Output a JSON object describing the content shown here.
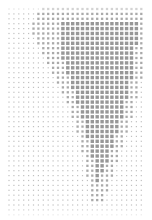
{
  "canvas": {
    "width": 152,
    "height": 220,
    "background": "#ffffff"
  },
  "grid": {
    "x0": 9,
    "y0": 9,
    "step": 4.9,
    "cols": 28,
    "rows": 43,
    "dot_color": "#8c8c8c",
    "min_size": 1.2,
    "max_size": 3.4
  },
  "shape": {
    "name": "silhouette",
    "polygon": [
      [
        40,
        8
      ],
      [
        145,
        8
      ],
      [
        145,
        60
      ],
      [
        138,
        95
      ],
      [
        128,
        130
      ],
      [
        118,
        160
      ],
      [
        108,
        190
      ],
      [
        102,
        205
      ],
      [
        92,
        200
      ],
      [
        86,
        170
      ],
      [
        80,
        140
      ],
      [
        70,
        110
      ],
      [
        55,
        80
      ],
      [
        40,
        50
      ],
      [
        30,
        30
      ]
    ],
    "inner_dense": [
      [
        60,
        20
      ],
      [
        140,
        20
      ],
      [
        130,
        90
      ],
      [
        112,
        150
      ],
      [
        98,
        185
      ],
      [
        90,
        150
      ],
      [
        80,
        110
      ],
      [
        62,
        60
      ]
    ]
  }
}
